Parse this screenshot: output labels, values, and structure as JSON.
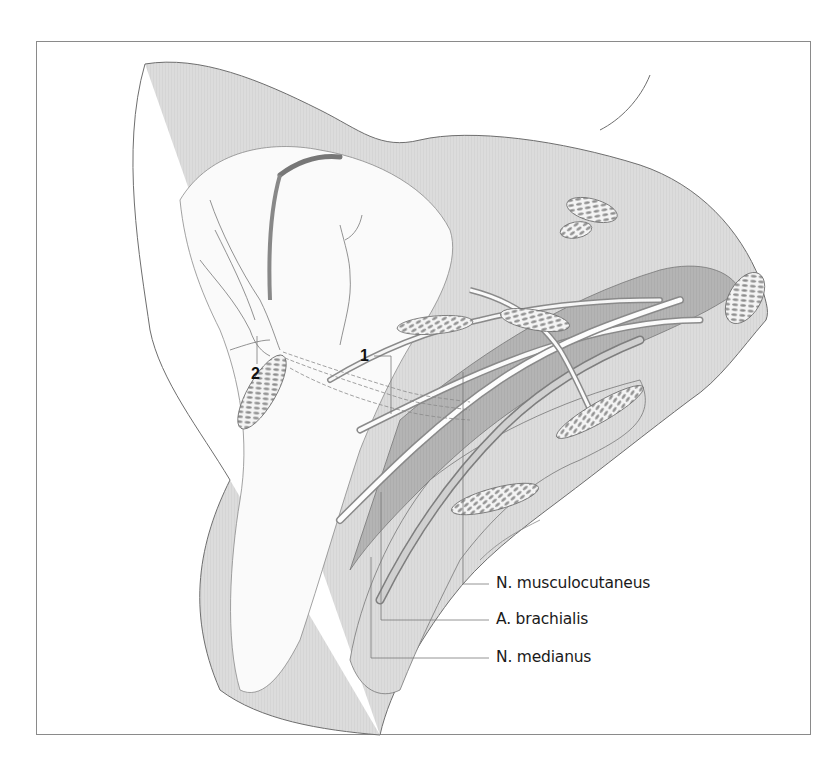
{
  "figure": {
    "type": "anatomical illustration",
    "numbered_markers": [
      {
        "id": "1",
        "label": "1"
      },
      {
        "id": "2",
        "label": "2"
      }
    ],
    "callouts": [
      {
        "id": "musculocutaneus",
        "label": "N. musculocutaneus"
      },
      {
        "id": "brachialis",
        "label": "A. brachialis"
      },
      {
        "id": "medianus",
        "label": "N. medianus"
      }
    ]
  },
  "colors": {
    "frame": "#8a8a8a",
    "outline": "#6e6e6e",
    "tissue_dark": "#9a9a9a",
    "tissue_mid": "#c4c4c4",
    "tissue_light": "#e6e6e6",
    "leader": "#7a7a7a"
  }
}
